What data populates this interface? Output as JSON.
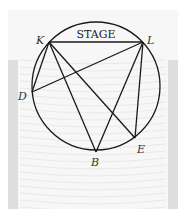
{
  "figure": {
    "title_label": "STAGE",
    "colors": {
      "stroke": "#1a1a1a",
      "seating_bg": "#f3f3f3",
      "seating_side": "#dcdcdc",
      "seat_lines": "#e6e6e6"
    },
    "circle": {
      "cx": 96,
      "cy": 86,
      "r": 64
    },
    "points": [
      {
        "id": "K",
        "label": "K",
        "x": 49,
        "y": 42,
        "lx": 36,
        "ly": 44
      },
      {
        "id": "L",
        "label": "L",
        "x": 143,
        "y": 42,
        "lx": 147,
        "ly": 44
      },
      {
        "id": "D",
        "label": "D",
        "x": 32,
        "y": 92,
        "lx": 18,
        "ly": 100
      },
      {
        "id": "B",
        "label": "B",
        "x": 96,
        "y": 152,
        "lx": 91,
        "ly": 166
      },
      {
        "id": "E",
        "label": "E",
        "x": 135,
        "y": 138,
        "lx": 137,
        "ly": 153
      }
    ],
    "segments": [
      [
        "K",
        "L"
      ],
      [
        "K",
        "D"
      ],
      [
        "K",
        "B"
      ],
      [
        "K",
        "E"
      ],
      [
        "L",
        "D"
      ],
      [
        "L",
        "B"
      ],
      [
        "L",
        "E"
      ]
    ]
  }
}
